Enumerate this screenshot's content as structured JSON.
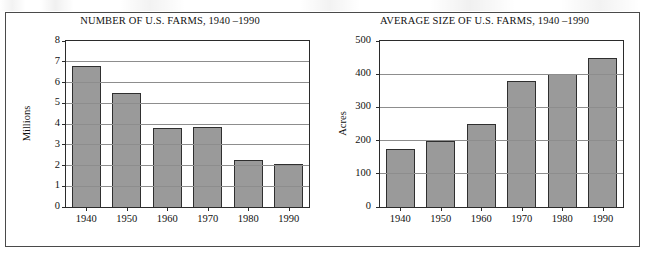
{
  "figure": {
    "panels": [
      {
        "title": "NUMBER OF U.S. FARMS, 1940 –1990",
        "ylabel": "Millions",
        "xtick_labels": [
          "1940",
          "1950",
          "1960",
          "1970",
          "1980",
          "1990"
        ],
        "ytick_labels": [
          "0",
          "1",
          "2",
          "3",
          "4",
          "5",
          "6",
          "7",
          "8"
        ]
      },
      {
        "title": "AVERAGE SIZE OF U.S. FARMS, 1940 –1990",
        "ylabel": "Acres",
        "xtick_labels": [
          "1940",
          "1950",
          "1960",
          "1970",
          "1980",
          "1990"
        ],
        "ytick_labels": [
          "0",
          "100",
          "200",
          "300",
          "400",
          "500"
        ]
      }
    ]
  },
  "style": {
    "bar_fill": "#9a9a9a",
    "bar_stroke": "#2f2f2f",
    "grid_color": "#8d8d8d",
    "frame_color": "#4a4a4a",
    "text_color": "#111111"
  },
  "chart_data": [
    {
      "type": "bar",
      "title": "NUMBER OF U.S. FARMS, 1940 –1990",
      "xlabel": "",
      "ylabel": "Millions",
      "categories": [
        "1940",
        "1950",
        "1960",
        "1970",
        "1980",
        "1990"
      ],
      "values": [
        6.8,
        5.5,
        3.8,
        3.85,
        2.25,
        2.05
      ],
      "ylim": [
        0,
        8
      ],
      "ytick_values": [
        0,
        1,
        2,
        3,
        4,
        5,
        6,
        7,
        8
      ],
      "grid": true,
      "grid_axis": "y",
      "legend": false,
      "legend_position": "none"
    },
    {
      "type": "bar",
      "title": "AVERAGE SIZE OF U.S. FARMS, 1940 –1990",
      "xlabel": "",
      "ylabel": "Acres",
      "categories": [
        "1940",
        "1950",
        "1960",
        "1970",
        "1980",
        "1990"
      ],
      "values": [
        175,
        200,
        250,
        380,
        400,
        450
      ],
      "ylim": [
        0,
        500
      ],
      "ytick_values": [
        0,
        100,
        200,
        300,
        400,
        500
      ],
      "grid": true,
      "grid_axis": "y",
      "legend": false,
      "legend_position": "none"
    }
  ]
}
